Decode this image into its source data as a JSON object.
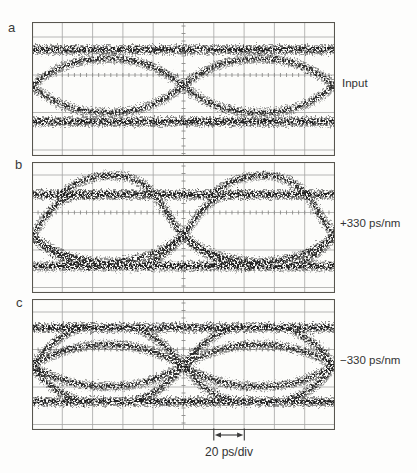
{
  "figure": {
    "panels": [
      {
        "letter": "a",
        "annotation": "Input"
      },
      {
        "letter": "b",
        "annotation": "+330 ps/nm"
      },
      {
        "letter": "c",
        "annotation": "−330 ps/nm"
      }
    ],
    "scale_bar": {
      "label": "20 ps/div"
    }
  },
  "chart_data": {
    "type": "scatter",
    "subtype": "oscilloscope-eye-diagram",
    "x_axis": {
      "label": "time",
      "scale": "20 ps/div",
      "divisions": 10
    },
    "y_axis": {
      "label": "amplitude",
      "divisions_spacing_px": 37.5
    },
    "legend": "none",
    "grid": {
      "width": 303,
      "cols": 10,
      "bg": "#fcfcfa",
      "line_color": "#a5a5a3",
      "tick_color": "#8a8a88",
      "frame_color": "#58564f",
      "ticked_row": 1,
      "minor_tick_dx": 6.06,
      "minor_tick_dy": 7.5
    },
    "trace_color": "#232321",
    "panels": [
      {
        "label": "a",
        "annotation": "Input",
        "height": 134,
        "grid_rows": [
          15,
          53,
          90.5,
          128
        ],
        "crossings_x": [
          0,
          151.5,
          303
        ],
        "crossing_y": 64,
        "rails": [
          "M0,28 H303",
          "M0,100 H303"
        ],
        "traces": [
          "M0,64 C22,46 42,37 75.75,37 C109,37 129,46 151.5,64 C173.5,46 193.5,37 227.25,37 C260.5,37 280.5,46 303,64",
          "M0,64 C22,82 42,91 75.75,91 C109,91 129,82 151.5,64 C173.5,82 193.5,91 227.25,91 C260.5,91 280.5,82 303,64"
        ]
      },
      {
        "label": "b",
        "annotation": "+330 ps/nm",
        "height": 131,
        "grid_rows": [
          13,
          50.5,
          88,
          125.5
        ],
        "crossings_x": [
          0,
          151.5,
          303
        ],
        "crossing_y": 74,
        "rails": [
          "M0,33 H303",
          "M0,104.5 H303"
        ],
        "traces": [
          "M28,34 C46,17 66,13 86,14 C106,15 121,28 131,44 C139,57 145,66 152,74 C161,83 173,93 187,98 C198,102 208,104 218,104.5",
          "M179.5,34 C197.5,17 217.5,13 237.5,14 C257.5,15 272.5,28 282.5,44 C290.5,57 296.5,66 303.5,74",
          "M-23.5,44 C-12.5,57 -6.5,66 0.5,74 C9.5,83 21.5,93 35.5,98 C46.5,102 56.5,104 66.5,104.5",
          "M113,103.5 C128,98 137,89 146,80 C151,75 157,67 163,58 C171,46 181,37.5 193,34 C201,31.8 209,33 216,33",
          "M-38.5,103.5 C-23.5,98 -14.5,89 -5.5,80 C-0.5,75 5.5,67 11.5,58 C19.5,46 29.5,37.5 41.5,34 C49.5,31.8 57.5,33 64.5,33",
          "M264.5,103.5 C279.5,98 288.5,89 297.5,80 C302.5,75 308.5,67 314.5,58",
          "M0,74 C22,92 45,100 75.75,100 C106.5,100 129.5,92 151.5,74 C173.5,92 196.5,100 227.25,100 C258,100 281,92 303,74"
        ]
      },
      {
        "label": "c",
        "annotation": "−330 ps/nm",
        "height": 131,
        "grid_rows": [
          13,
          50.5,
          88,
          125.5
        ],
        "crossings_x": [
          0,
          151.5,
          303
        ],
        "crossing_y": 67,
        "rails": [
          "M0,29 H303",
          "M0,103 H303"
        ],
        "traces": [
          "M0,67 C24,53 46,46 75.75,46 C105.5,46 127.5,53 151.5,67 C175.5,53 197.5,46 227.25,46 C257,46 279,53 303,67",
          "M0,67 C24,81 46,88 75.75,88 C105.5,88 127.5,81 151.5,67 C175.5,81 197.5,88 227.25,88 C257,88 279,81 303,67",
          "M-45,30 C-20,42 -10,55 0,67 C10,79 20,92 45,101",
          "M-45,101 C-20,92 -10,79 0,67 C10,55 20,42 45,30",
          "M106.5,30 C131.5,42 141.5,55 151.5,67 C161.5,79 171.5,92 196.5,101",
          "M106.5,101 C131.5,92 141.5,79 151.5,67 C161.5,55 171.5,42 196.5,30",
          "M258,30 C283,42 293,55 303,67",
          "M258,101 C283,92 293,79 303,67"
        ]
      }
    ]
  }
}
